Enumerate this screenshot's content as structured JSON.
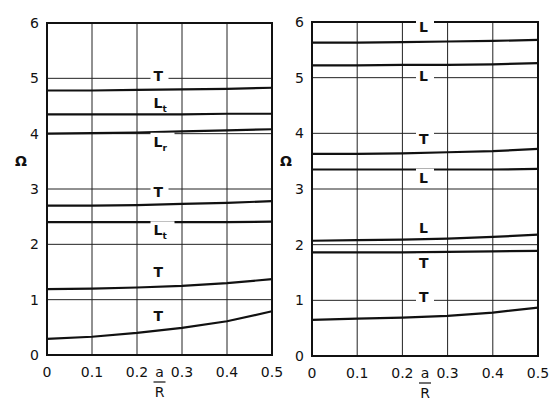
{
  "chart_data": [
    {
      "type": "line",
      "title": "",
      "xlabel": "a/R",
      "ylabel": "Ω",
      "xlim": [
        0,
        0.5
      ],
      "ylim": [
        0,
        6
      ],
      "grid": true,
      "xticks": [
        "0",
        "0.1",
        "0.2",
        "0.3",
        "0.4",
        "0.5"
      ],
      "yticks": [
        "0",
        "1",
        "2",
        "3",
        "4",
        "5",
        "6"
      ],
      "x": [
        0,
        0.1,
        0.2,
        0.3,
        0.4,
        0.5
      ],
      "series": [
        {
          "name": "T",
          "label_main": "T",
          "label_sub": "",
          "values": [
            4.78,
            4.78,
            4.79,
            4.8,
            4.81,
            4.83
          ],
          "label_at": [
            0.25,
            4.98
          ]
        },
        {
          "name": "L_t",
          "label_main": "L",
          "label_sub": "t",
          "values": [
            4.35,
            4.35,
            4.35,
            4.35,
            4.36,
            4.36
          ],
          "label_at": [
            0.25,
            4.5
          ]
        },
        {
          "name": "L_r",
          "label_main": "L",
          "label_sub": "r",
          "values": [
            4.0,
            4.01,
            4.02,
            4.04,
            4.06,
            4.08
          ],
          "label_at": [
            0.25,
            3.8
          ]
        },
        {
          "name": "T",
          "label_main": "T",
          "label_sub": "",
          "values": [
            2.7,
            2.7,
            2.71,
            2.73,
            2.75,
            2.78
          ],
          "label_at": [
            0.25,
            2.9
          ]
        },
        {
          "name": "L_t",
          "label_main": "L",
          "label_sub": "t",
          "values": [
            2.4,
            2.4,
            2.4,
            2.4,
            2.4,
            2.41
          ],
          "label_at": [
            0.25,
            2.2
          ]
        },
        {
          "name": "T",
          "label_main": "T",
          "label_sub": "",
          "values": [
            1.19,
            1.2,
            1.22,
            1.25,
            1.3,
            1.37
          ],
          "label_at": [
            0.25,
            1.45
          ]
        },
        {
          "name": "T",
          "label_main": "T",
          "label_sub": "",
          "values": [
            0.29,
            0.33,
            0.4,
            0.49,
            0.61,
            0.79
          ],
          "label_at": [
            0.25,
            0.65
          ]
        }
      ]
    },
    {
      "type": "line",
      "title": "",
      "xlabel": "a/R",
      "ylabel": "Ω",
      "xlim": [
        0,
        0.5
      ],
      "ylim": [
        0,
        6
      ],
      "grid": true,
      "xticks": [
        "0",
        "0.1",
        "0.2",
        "0.3",
        "0.4",
        "0.5"
      ],
      "yticks": [
        "0",
        "1",
        "2",
        "3",
        "4",
        "5",
        "6"
      ],
      "x": [
        0,
        0.1,
        0.2,
        0.3,
        0.4,
        0.5
      ],
      "series": [
        {
          "name": "L",
          "label_main": "L",
          "label_sub": "",
          "values": [
            5.63,
            5.63,
            5.64,
            5.65,
            5.66,
            5.68
          ],
          "label_at": [
            0.25,
            5.85
          ]
        },
        {
          "name": "L",
          "label_main": "L",
          "label_sub": "",
          "values": [
            5.22,
            5.22,
            5.23,
            5.23,
            5.24,
            5.26
          ],
          "label_at": [
            0.25,
            4.98
          ]
        },
        {
          "name": "T",
          "label_main": "T",
          "label_sub": "",
          "values": [
            3.63,
            3.63,
            3.64,
            3.66,
            3.68,
            3.72
          ],
          "label_at": [
            0.25,
            3.85
          ]
        },
        {
          "name": "L",
          "label_main": "L",
          "label_sub": "",
          "values": [
            3.35,
            3.35,
            3.35,
            3.35,
            3.35,
            3.36
          ],
          "label_at": [
            0.25,
            3.15
          ]
        },
        {
          "name": "L",
          "label_main": "L",
          "label_sub": "",
          "values": [
            2.07,
            2.08,
            2.09,
            2.11,
            2.14,
            2.18
          ],
          "label_at": [
            0.25,
            2.25
          ]
        },
        {
          "name": "T",
          "label_main": "T",
          "label_sub": "",
          "values": [
            1.86,
            1.86,
            1.86,
            1.87,
            1.88,
            1.89
          ],
          "label_at": [
            0.25,
            1.62
          ]
        },
        {
          "name": "T",
          "label_main": "T",
          "label_sub": "",
          "values": [
            0.65,
            0.67,
            0.69,
            0.72,
            0.78,
            0.87
          ],
          "label_at": [
            0.25,
            1.0
          ]
        }
      ]
    }
  ],
  "panels": [
    {
      "x0": 47,
      "x1": 272,
      "y0": 355,
      "y1": 23
    },
    {
      "x0": 312,
      "x1": 538,
      "y0": 356,
      "y1": 22
    }
  ],
  "axis": {
    "ylabel": "Ω",
    "xlabel_num": "a",
    "xlabel_den": "R"
  }
}
